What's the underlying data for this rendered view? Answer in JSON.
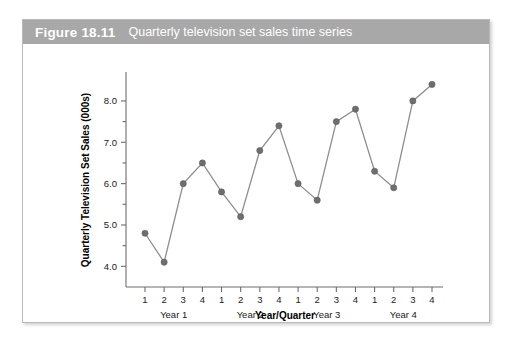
{
  "figure": {
    "label": "Figure 18.11",
    "caption": "Quarterly television set sales time series",
    "header_color": "#a8a8a8",
    "border_color": "#b9b9b9"
  },
  "chart_data": {
    "type": "line",
    "title": "Quarterly television set sales time series",
    "xlabel": "Year/Quarter",
    "ylabel": "Quarterly Television Set Sales (000s)",
    "categories": [
      "1",
      "2",
      "3",
      "4",
      "1",
      "2",
      "3",
      "4",
      "1",
      "2",
      "3",
      "4",
      "1",
      "2",
      "3",
      "4"
    ],
    "group_labels": [
      "Year 1",
      "Year 2",
      "Year 3",
      "Year 4"
    ],
    "values": [
      4.8,
      4.1,
      6.0,
      6.5,
      5.8,
      5.2,
      6.8,
      7.4,
      6.0,
      5.6,
      7.5,
      7.8,
      6.3,
      5.9,
      8.0,
      8.4
    ],
    "ylim": [
      3.5,
      8.7
    ],
    "yticks": [
      4.0,
      5.0,
      6.0,
      7.0,
      8.0
    ],
    "ytick_labels": [
      "4.0",
      "5.0",
      "6.0",
      "7.0",
      "8.0"
    ],
    "yminor_ticks": [
      4.5,
      5.5,
      6.5,
      7.5
    ],
    "grid": false,
    "legend": "none",
    "line_color": "#8e8e8e",
    "marker_color": "#6e6e6e"
  }
}
